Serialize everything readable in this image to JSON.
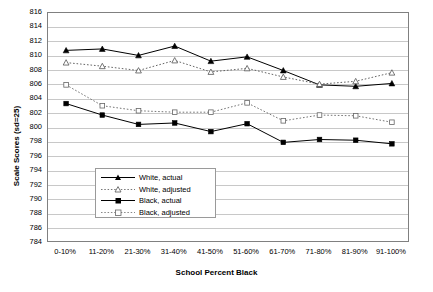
{
  "chart_data": {
    "type": "line",
    "title": "",
    "xlabel": "School Percent Black",
    "ylabel": "Scale Scores (sd=25)",
    "categories": [
      "0-10%",
      "11-20%",
      "21-30%",
      "31-40%",
      "41-50%",
      "51-60%",
      "61-70%",
      "71-80%",
      "81-90%",
      "91-100%"
    ],
    "ylim": [
      784,
      816
    ],
    "ytick_step": 2,
    "yticks": [
      816,
      814,
      812,
      810,
      808,
      806,
      804,
      802,
      800,
      798,
      796,
      794,
      792,
      790,
      788,
      786,
      784
    ],
    "grid": true,
    "legend_position": "inside-lower-left",
    "series": [
      {
        "name": "White, actual",
        "marker": "filled-triangle",
        "line": "solid",
        "color": "#000000",
        "values": [
          810.8,
          811.0,
          810.1,
          811.4,
          809.3,
          809.9,
          808.0,
          806.0,
          805.8,
          806.2
        ]
      },
      {
        "name": "White, adjusted",
        "marker": "open-triangle",
        "line": "dotted",
        "color": "#555555",
        "values": [
          809.1,
          808.6,
          808.0,
          809.4,
          807.8,
          808.3,
          807.1,
          806.1,
          806.5,
          807.7
        ]
      },
      {
        "name": "Black, actual",
        "marker": "filled-square",
        "line": "solid",
        "color": "#000000",
        "values": [
          803.4,
          801.8,
          800.5,
          800.7,
          799.5,
          800.6,
          798.0,
          798.4,
          798.3,
          797.8
        ]
      },
      {
        "name": "Black, adjusted",
        "marker": "open-square",
        "line": "dotted",
        "color": "#666666",
        "values": [
          806.0,
          803.1,
          802.4,
          802.2,
          802.2,
          803.5,
          801.0,
          801.8,
          801.7,
          800.8
        ]
      }
    ]
  },
  "legend": {
    "items": [
      {
        "label": "White, actual"
      },
      {
        "label": "White, adjusted"
      },
      {
        "label": "Black, actual"
      },
      {
        "label": "Black, adjusted"
      }
    ]
  },
  "colors": {
    "axis": "#808080",
    "grid": "#c8c8c8",
    "series_dark": "#000000",
    "series_light": "#666666",
    "background": "#ffffff"
  }
}
